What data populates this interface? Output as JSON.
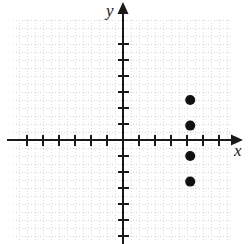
{
  "figure": {
    "kind": "coordinate-plane-scatter",
    "background_color": "#ffffff",
    "axis_color": "#1a1a1a",
    "grid_color": "#d8d8d8",
    "point_color": "#111111"
  },
  "axes": {
    "x_label": "x",
    "y_label": "y",
    "origin_px": [
      123,
      140
    ],
    "unit_px": 16,
    "grid_cell_px": 8,
    "x_range": [
      -6.9,
      6.8
    ],
    "y_range": [
      -6.3,
      7.5
    ],
    "tick_marks_shown": true,
    "tick_labels_shown": false,
    "arrow_x_positive": true,
    "arrow_y_positive": true,
    "grid_on": true
  },
  "chart_data": {
    "type": "scatter",
    "title": "",
    "xlabel": "x",
    "ylabel": "y",
    "xlim": [
      -6.9,
      6.8
    ],
    "ylim": [
      -6.3,
      7.5
    ],
    "grid": true,
    "legend": "none",
    "x_ticks": [
      -6,
      -5,
      -4,
      -3,
      -2,
      -1,
      1,
      2,
      3,
      4,
      5,
      6
    ],
    "y_ticks": [
      -6,
      -5,
      -4,
      -3,
      -2,
      -1,
      1,
      2,
      3,
      4,
      5,
      6
    ],
    "series": [
      {
        "name": "plotted points",
        "marker": "filled-circle",
        "marker_radius_px": 5,
        "points": [
          {
            "x": 4.2,
            "y": 2.5
          },
          {
            "x": 4.2,
            "y": 0.9
          },
          {
            "x": 4.2,
            "y": -1.0
          },
          {
            "x": 4.2,
            "y": -2.6
          }
        ]
      }
    ]
  }
}
